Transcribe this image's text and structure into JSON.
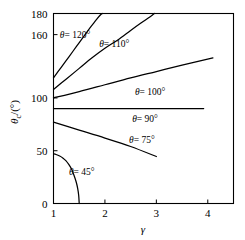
{
  "chart_data": {
    "type": "line",
    "title": "",
    "subtitle": "",
    "xlabel": "γ",
    "ylabel": "θc /(°)",
    "ylabel_parts": {
      "symbol": "θ",
      "sub": "c",
      "unit": "/(°)"
    },
    "xlim": [
      1,
      4.5
    ],
    "ylim": [
      0,
      180
    ],
    "xticks": [
      1,
      2,
      3,
      4
    ],
    "xtick_labels": [
      "1",
      "2",
      "3",
      "4"
    ],
    "yticks": [
      0,
      50,
      100,
      160,
      180
    ],
    "ytick_labels": [
      "0",
      "50",
      "100",
      "160",
      "180"
    ],
    "grid": false,
    "legend": "inline-annotations",
    "frame": "box",
    "series": [
      {
        "name": "θ= 45°",
        "label": "θ= 45°",
        "label_x": 1.55,
        "label_y": 27,
        "points": [
          [
            1.0,
            47
          ],
          [
            1.05,
            46.4
          ],
          [
            1.12,
            45.0
          ],
          [
            1.18,
            43.2
          ],
          [
            1.24,
            40.6
          ],
          [
            1.3,
            36.8
          ],
          [
            1.35,
            32.6
          ],
          [
            1.4,
            26.6
          ],
          [
            1.44,
            20.6
          ],
          [
            1.47,
            14.4
          ],
          [
            1.49,
            7.6
          ],
          [
            1.5,
            0
          ]
        ]
      },
      {
        "name": "θ= 75°",
        "label": "θ= 75°",
        "label_x": 2.72,
        "label_y": 57,
        "points": [
          [
            1.0,
            77
          ],
          [
            1.5,
            69.5
          ],
          [
            2.0,
            62
          ],
          [
            2.5,
            54
          ],
          [
            3.0,
            44.5
          ]
        ]
      },
      {
        "name": "θ= 90°",
        "label": "θ= 90°",
        "label_x": 2.78,
        "label_y": 77,
        "points": [
          [
            1.0,
            90
          ],
          [
            2.0,
            90
          ],
          [
            3.0,
            90
          ],
          [
            3.92,
            90
          ]
        ]
      },
      {
        "name": "θ= 100°",
        "label": "θ= 100°",
        "label_x": 2.88,
        "label_y": 103,
        "points": [
          [
            1.0,
            100
          ],
          [
            1.5,
            106
          ],
          [
            2.0,
            112.5
          ],
          [
            2.5,
            119
          ],
          [
            3.0,
            125
          ],
          [
            3.5,
            131
          ],
          [
            4.1,
            138
          ]
        ]
      },
      {
        "name": "θ= 110°",
        "label": "θ= 110°",
        "label_x": 2.18,
        "label_y": 148,
        "points": [
          [
            1.0,
            108
          ],
          [
            1.25,
            118
          ],
          [
            1.5,
            128
          ],
          [
            1.75,
            138
          ],
          [
            2.0,
            147
          ],
          [
            2.25,
            155
          ],
          [
            2.5,
            164
          ],
          [
            2.7,
            171
          ],
          [
            2.88,
            177
          ],
          [
            2.96,
            180
          ]
        ]
      },
      {
        "name": "θ= 120°",
        "label": "θ= 120°",
        "label_x": 1.42,
        "label_y": 157,
        "points": [
          [
            1.0,
            119
          ],
          [
            1.15,
            129
          ],
          [
            1.3,
            139
          ],
          [
            1.45,
            149
          ],
          [
            1.6,
            159
          ],
          [
            1.72,
            167
          ],
          [
            1.83,
            174
          ],
          [
            1.92,
            179
          ],
          [
            1.95,
            180
          ]
        ]
      }
    ]
  }
}
